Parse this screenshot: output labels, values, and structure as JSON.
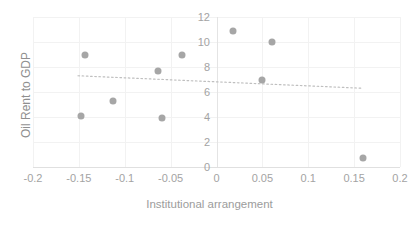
{
  "chart_data": {
    "type": "scatter",
    "title": "",
    "xlabel": "Institutional arrangement",
    "ylabel": "Oil Rent to GDP",
    "xlim": [
      -0.2,
      0.2
    ],
    "ylim": [
      0,
      12
    ],
    "xticks": [
      "-0.2",
      "-0.15",
      "-0.1",
      "-0.05",
      "0",
      "0.05",
      "0.1",
      "0.15",
      "0.2"
    ],
    "xtick_values": [
      -0.2,
      -0.15,
      -0.1,
      -0.05,
      0,
      0.05,
      0.1,
      0.15,
      0.2
    ],
    "yticks": [
      "0",
      "2",
      "4",
      "6",
      "8",
      "10",
      "12"
    ],
    "ytick_values": [
      0,
      2,
      4,
      6,
      8,
      10,
      12
    ],
    "grid": true,
    "legend": "none",
    "marker_color": "#a6a6a6",
    "trendline_color": "#bfbfbf",
    "axis_text_color": "#a3a3a3",
    "points": [
      {
        "x": -0.148,
        "y": 4.1
      },
      {
        "x": -0.143,
        "y": 9.0
      },
      {
        "x": -0.113,
        "y": 5.3
      },
      {
        "x": -0.064,
        "y": 7.7
      },
      {
        "x": -0.059,
        "y": 3.9
      },
      {
        "x": -0.038,
        "y": 9.0
      },
      {
        "x": 0.018,
        "y": 10.9
      },
      {
        "x": 0.05,
        "y": 7.0
      },
      {
        "x": 0.061,
        "y": 10.0
      },
      {
        "x": 0.16,
        "y": 0.7
      }
    ],
    "trendline": {
      "style": "dotted",
      "x_start": -0.151,
      "y_start": 7.3,
      "x_end": 0.159,
      "y_end": 6.3
    }
  }
}
